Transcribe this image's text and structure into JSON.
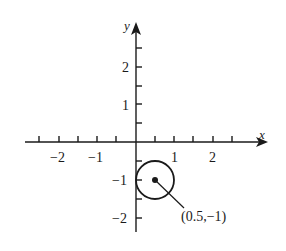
{
  "diagram": {
    "type": "coordinate-plane",
    "axes": {
      "x_label": "x",
      "y_label": "y",
      "x_range": [
        -2.5,
        2.5
      ],
      "y_range": [
        -2,
        2.5
      ],
      "tick_step": 0.5,
      "x_tick_labels": [
        "−2",
        "−1",
        "1",
        "2"
      ],
      "y_tick_labels": [
        "2",
        "1",
        "−1",
        "−2"
      ]
    },
    "circle": {
      "center": [
        0.5,
        -1
      ],
      "radius": 0.5
    },
    "annotation": {
      "label": "(0.5,−1)"
    },
    "colors": {
      "stroke": "#1a1a1a",
      "background": "#ffffff"
    }
  }
}
